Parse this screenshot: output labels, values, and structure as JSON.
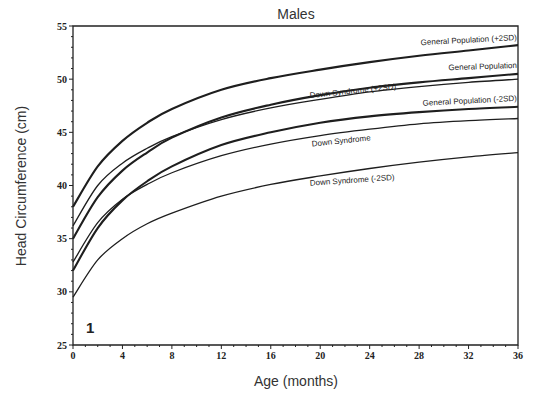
{
  "chart_data": {
    "type": "line",
    "title": "Males",
    "xlabel": "Age (months)",
    "ylabel": "Head Circumference (cm)",
    "xlim": [
      0,
      36
    ],
    "ylim": [
      25,
      55
    ],
    "xticks": [
      0,
      4,
      8,
      12,
      16,
      20,
      24,
      28,
      32,
      36
    ],
    "yticks": [
      25,
      30,
      35,
      40,
      45,
      50,
      55
    ],
    "grid": false,
    "legend": "inline labels at right of each curve",
    "panel_label": "1",
    "x": [
      0,
      2,
      4,
      6,
      8,
      12,
      16,
      20,
      24,
      28,
      32,
      36
    ],
    "series": [
      {
        "name": "General Population (+2SD)",
        "values": [
          38.0,
          41.8,
          44.2,
          45.9,
          47.2,
          49.0,
          50.1,
          50.9,
          51.6,
          52.2,
          52.7,
          53.2
        ],
        "weight": "bold"
      },
      {
        "name": "General Population",
        "values": [
          35.0,
          38.9,
          41.4,
          43.1,
          44.5,
          46.4,
          47.6,
          48.5,
          49.2,
          49.7,
          50.1,
          50.5
        ],
        "weight": "bold"
      },
      {
        "name": "Down Syndrome (+2SD)",
        "values": [
          36.2,
          40.0,
          42.1,
          43.5,
          44.6,
          46.2,
          47.3,
          48.1,
          48.8,
          49.3,
          49.7,
          50.0
        ],
        "weight": "normal"
      },
      {
        "name": "General Population (-2SD)",
        "values": [
          32.0,
          36.0,
          38.6,
          40.4,
          41.8,
          43.8,
          45.0,
          45.9,
          46.5,
          46.9,
          47.2,
          47.4
        ],
        "weight": "bold"
      },
      {
        "name": "Down Syndrome",
        "values": [
          32.8,
          36.5,
          38.7,
          40.1,
          41.2,
          42.8,
          43.9,
          44.7,
          45.3,
          45.8,
          46.1,
          46.3
        ],
        "weight": "normal"
      },
      {
        "name": "Down Syndrome (-2SD)",
        "values": [
          29.5,
          33.0,
          35.0,
          36.4,
          37.4,
          39.0,
          40.1,
          40.9,
          41.6,
          42.2,
          42.7,
          43.1
        ],
        "weight": "normal"
      }
    ]
  }
}
